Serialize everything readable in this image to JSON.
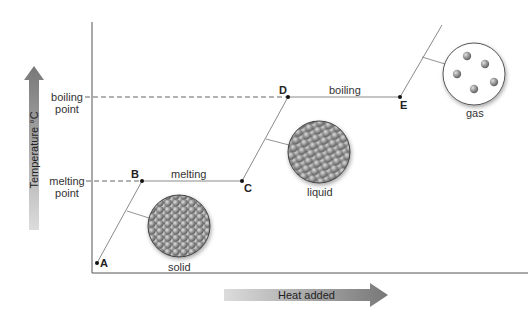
{
  "diagram": {
    "y_axis": {
      "label": "Temperature °C"
    },
    "x_axis": {
      "label": "Heat added"
    },
    "levels": [
      {
        "label_line1": "boiling",
        "label_line2": "point"
      },
      {
        "label_line1": "melting",
        "label_line2": "point"
      }
    ],
    "points": [
      "A",
      "B",
      "C",
      "D",
      "E"
    ],
    "segments": [
      {
        "label": "melting",
        "from": "B",
        "to": "C"
      },
      {
        "label": "boiling",
        "from": "D",
        "to": "E"
      }
    ],
    "states": [
      {
        "label": "solid"
      },
      {
        "label": "liquid"
      },
      {
        "label": "gas"
      }
    ],
    "colors": {
      "axis": "#555555",
      "curve": "#888888",
      "arrow_dark": "#777777",
      "arrow_light": "#dddddd",
      "particle": "#8a8a8a"
    }
  }
}
